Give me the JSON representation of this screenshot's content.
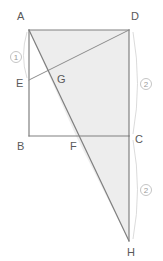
{
  "figure": {
    "background_color": "#ffffff",
    "stroke_color": "#808080",
    "shade_color": "#ededed",
    "label_color": "#595959",
    "mark_color": "#9a9a9a",
    "arc_color": "#d2d2d2",
    "points": [
      {
        "id": "A",
        "label": "A",
        "x": 29,
        "y": 30,
        "label_x": 17,
        "label_y": 20
      },
      {
        "id": "D",
        "label": "D",
        "x": 129,
        "y": 30,
        "label_x": 131,
        "label_y": 20
      },
      {
        "id": "E",
        "label": "E",
        "x": 29,
        "y": 80,
        "label_x": 16,
        "label_y": 87
      },
      {
        "id": "G",
        "label": "G",
        "x": 54,
        "y": 76,
        "label_x": 57,
        "label_y": 83
      },
      {
        "id": "B",
        "label": "B",
        "x": 29,
        "y": 136,
        "label_x": 17,
        "label_y": 150
      },
      {
        "id": "F",
        "label": "F",
        "x": 76,
        "y": 136,
        "label_x": 70,
        "label_y": 150
      },
      {
        "id": "C",
        "label": "C",
        "x": 129,
        "y": 136,
        "label_x": 135,
        "label_y": 143
      },
      {
        "id": "H",
        "label": "H",
        "x": 129,
        "y": 241,
        "label_x": 127,
        "label_y": 256
      }
    ],
    "segments": [
      {
        "name": "side-AD",
        "from": "A",
        "to": "D"
      },
      {
        "name": "side-AB",
        "from": "A",
        "to": "B"
      },
      {
        "name": "side-BC",
        "from": "B",
        "to": "C"
      },
      {
        "name": "side-DC",
        "from": "D",
        "to": "C"
      },
      {
        "name": "segment-CH",
        "from": "C",
        "to": "H"
      },
      {
        "name": "segment-ED",
        "from": "E",
        "to": "D"
      },
      {
        "name": "segment-AH",
        "from": "A",
        "to": "H"
      }
    ],
    "shaded_regions": [
      {
        "name": "region-ADCF-A",
        "polygon": "29,30 129,30 129,136 76,136"
      },
      {
        "name": "region-FCH",
        "polygon": "76,136 129,136 129,241"
      }
    ],
    "ratio_marks": [
      {
        "id": "mark-1",
        "label": "1",
        "cx": 16,
        "cy": 57,
        "r": 5.5,
        "arc": "M 27,32 Q 20,56 27,78",
        "target": "segment-AE"
      },
      {
        "id": "mark-2a",
        "label": "2",
        "cx": 146,
        "cy": 84,
        "r": 5.5,
        "arc": "M 133,32 Q 142,84 133,134",
        "target": "segment-DC"
      },
      {
        "id": "mark-2b",
        "label": "2",
        "cx": 146,
        "cy": 190,
        "r": 5.5,
        "arc": "M 133,140 Q 142,190 133,239",
        "target": "segment-CH"
      }
    ]
  }
}
